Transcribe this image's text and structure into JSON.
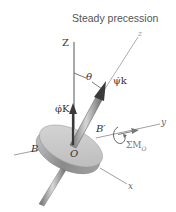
{
  "title": "Steady precession",
  "labels": {
    "Z_axis": "Z",
    "z_axis": "z",
    "theta": "θ",
    "spin": "ψ̇k",
    "precession": "φ̇K",
    "B_prime": "B′",
    "B": "B",
    "O": "O",
    "y_axis": "y",
    "x_axis": "x",
    "moment": "ΣM",
    "moment_sub": "O"
  },
  "colors": {
    "vector_arrow": "#3a3a3a",
    "disk_face": "#c9c9c9",
    "disk_edge": "#8e8e8e",
    "axis_line": "#7a7a7a",
    "text": "#333333"
  }
}
